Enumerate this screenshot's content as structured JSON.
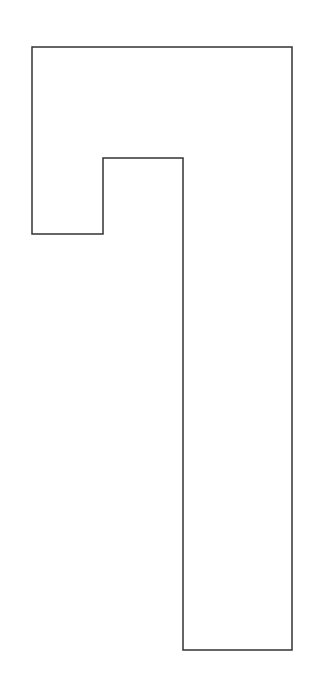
{
  "diagram": {
    "type": "polygon-outline",
    "stroke_color": "#333333",
    "fill_color": "#ffffff",
    "background": "#ffffff",
    "stroke_width": 1.5,
    "points": [
      [
        32,
        47
      ],
      [
        292,
        47
      ],
      [
        292,
        650
      ],
      [
        183,
        650
      ],
      [
        183,
        158
      ],
      [
        103,
        158
      ],
      [
        103,
        234
      ],
      [
        32,
        234
      ]
    ]
  }
}
